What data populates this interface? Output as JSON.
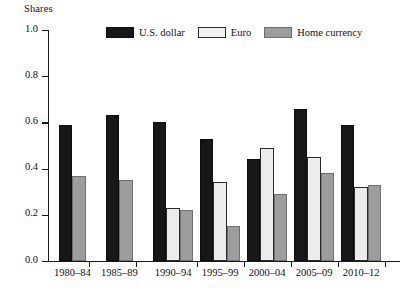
{
  "chart_data": {
    "type": "bar",
    "title": "",
    "subtitle": "",
    "xlabel": "",
    "ylabel": "Shares",
    "ylim": [
      0.0,
      1.0
    ],
    "grid": false,
    "legend_position": "top-center",
    "ytick_labels": [
      "1.0",
      "0.8",
      "0.6",
      "0.4",
      "0.2",
      "0.0"
    ],
    "ytick_values": [
      1.0,
      0.8,
      0.6,
      0.4,
      0.2,
      0.0
    ],
    "categories": [
      "1980–84",
      "1985–89",
      "1990–94",
      "1995–99",
      "2000–04",
      "2005–09",
      "2010–12"
    ],
    "series": [
      {
        "name": "U.S. dollar",
        "color": "#171717",
        "values": [
          0.59,
          0.63,
          0.6,
          0.53,
          0.44,
          0.66,
          0.59
        ]
      },
      {
        "name": "Euro",
        "color": "#ececec",
        "values": [
          null,
          null,
          0.23,
          0.34,
          0.49,
          0.45,
          0.32
        ]
      },
      {
        "name": "Home currency",
        "color": "#9d9d9d",
        "values": [
          0.37,
          0.35,
          0.22,
          0.15,
          0.29,
          0.38,
          0.33
        ]
      }
    ]
  },
  "legend": {
    "items": [
      {
        "label": "U.S. dollar",
        "key": "usd"
      },
      {
        "label": "Euro",
        "key": "eur"
      },
      {
        "label": "Home currency",
        "key": "home"
      }
    ]
  },
  "axis": {
    "y_title": "Shares"
  }
}
